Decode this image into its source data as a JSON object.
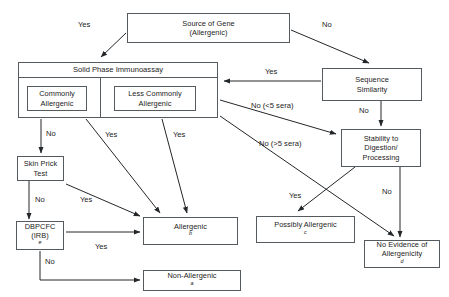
{
  "diagram": {
    "line_color": "#23272a",
    "box_border_color": "#555a5e",
    "text_color": "#1b1b1b"
  },
  "nodes": {
    "source_gene": {
      "line1": "Source of Gene",
      "line2": "(Allergenic)"
    },
    "solid_phase": {
      "header": "Solid Phase Immunoassay"
    },
    "commonly": {
      "line1": "Commonly",
      "line2": "Allergenic"
    },
    "less_commonly": {
      "line1": "Less Commonly",
      "line2": "Allergenic"
    },
    "sequence_similarity": {
      "line1": "Sequence",
      "line2": "Similarity"
    },
    "stability": {
      "line1": "Stability to",
      "line2": "Digestion/",
      "line3": "Processing"
    },
    "skin_prick": {
      "line1": "Skin Prick",
      "line2": "Test"
    },
    "dbpcfc": {
      "line1": "DBPCFC",
      "line2": "(IRB)",
      "sup": "e"
    },
    "allergenic": {
      "text": "Allergenic",
      "sup": "b"
    },
    "possibly_allergenic": {
      "text": "Possibly Allergenic",
      "sup": "c"
    },
    "no_evidence": {
      "line1": "No Evidence of",
      "line2": "Allergenicity",
      "sup": "d"
    },
    "non_allergenic": {
      "text": "Non-Allergenic",
      "sup": "a"
    }
  },
  "edge_labels": {
    "source_to_spi": "Yes",
    "source_to_seq": "No",
    "seq_to_spi": "Yes",
    "seq_to_stability": "No",
    "spi_no_lt5": "No (<5 sera)",
    "spi_no_gt5": "No (>5 sera)",
    "commonly_no": "No",
    "commonly_yes": "Yes",
    "less_commonly_yes": "Yes",
    "skin_prick_no": "No",
    "skin_prick_yes": "Yes",
    "dbpcfc_yes": "Yes",
    "dbpcfc_no": "No",
    "stability_yes": "Yes",
    "stability_no": "No"
  }
}
